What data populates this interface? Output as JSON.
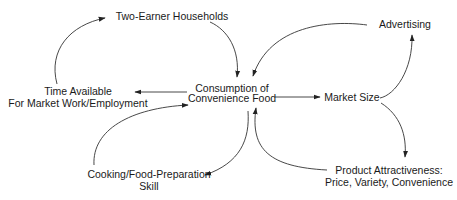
{
  "diagram": {
    "type": "causal-loop",
    "nodes": {
      "two_earner": {
        "label": "Two-Earner Households"
      },
      "advertising": {
        "label": "Advertising"
      },
      "consumption": {
        "line1": "Consumption of",
        "line2": "Convenience Food"
      },
      "time_available": {
        "line1": "Time Available",
        "line2": "For Market Work/Employment"
      },
      "market_size": {
        "label": "Market Size"
      },
      "cooking_skill": {
        "line1": "Cooking/Food-Preparation",
        "line2": "Skill"
      },
      "product_attractiveness": {
        "line1": "Product Attractiveness:",
        "line2": "Price, Variety, Convenience"
      }
    },
    "edges": [
      {
        "from": "Two-Earner Households",
        "to": "Consumption of Convenience Food"
      },
      {
        "from": "Advertising",
        "to": "Consumption of Convenience Food"
      },
      {
        "from": "Consumption of Convenience Food",
        "to": "Time Available For Market Work/Employment"
      },
      {
        "from": "Time Available For Market Work/Employment",
        "to": "Two-Earner Households"
      },
      {
        "from": "Consumption of Convenience Food",
        "to": "Market Size"
      },
      {
        "from": "Market Size",
        "to": "Advertising"
      },
      {
        "from": "Market Size",
        "to": "Product Attractiveness: Price, Variety, Convenience"
      },
      {
        "from": "Product Attractiveness: Price, Variety, Convenience",
        "to": "Consumption of Convenience Food"
      },
      {
        "from": "Consumption of Convenience Food",
        "to": "Cooking/Food-Preparation Skill"
      },
      {
        "from": "Cooking/Food-Preparation Skill",
        "to": "Consumption of Convenience Food"
      }
    ],
    "colors": {
      "line": "#333333",
      "text": "#1a1a1a",
      "background": "#ffffff"
    }
  }
}
